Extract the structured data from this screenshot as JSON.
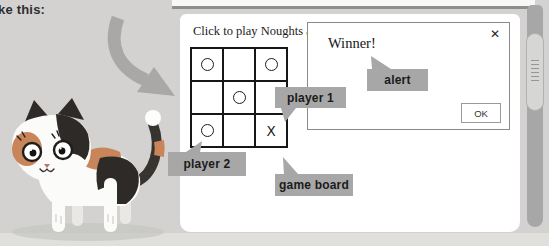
{
  "annotations": {
    "caption": "ke this:",
    "callouts": {
      "player1": {
        "label": "player 1"
      },
      "player2": {
        "label": "player 2"
      },
      "alert": {
        "label": "alert"
      },
      "game_board": {
        "label": "game board"
      }
    }
  },
  "screen": {
    "instruction": "Click to play Noughts and",
    "board": {
      "cells": [
        "O",
        "",
        "O",
        "",
        "O",
        "",
        "O",
        "",
        "X"
      ]
    },
    "dialog": {
      "title": "Winner!",
      "close_icon": "✕",
      "ok_button": "OK"
    }
  },
  "illustrations": {
    "cat": "calico-cat-illustration",
    "arrow": "curved-gray-arrow"
  },
  "colors": {
    "page_background": "#d3d2d0",
    "panel": "#ffffff",
    "callout_bg": "#a7a7a7",
    "arrow": "#a9a8a6",
    "grid_line": "#161616",
    "dialog_border": "#8a8a8a",
    "scrollbar_track": "#a7a7a7",
    "scrollbar_thumb": "#d6d6d4",
    "cat_orange": "#c8855a",
    "cat_black": "#2d2a28"
  }
}
